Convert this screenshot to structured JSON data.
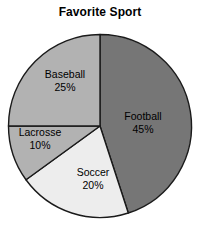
{
  "chart_data": {
    "type": "pie",
    "title": "Favorite Sport",
    "xlabel": "",
    "ylabel": "",
    "legend": "none",
    "grid": false,
    "categories": [
      "Football",
      "Soccer",
      "Lacrosse",
      "Baseball"
    ],
    "values": [
      45,
      20,
      10,
      25
    ],
    "units": "percent",
    "start_angle_deg": 0,
    "direction": "clockwise",
    "slices": [
      {
        "label": "Football",
        "value": 45,
        "value_text": "45%",
        "color": "#767676",
        "start_deg": 0,
        "end_deg": 162
      },
      {
        "label": "Soccer",
        "value": 20,
        "value_text": "20%",
        "color": "#ededed",
        "start_deg": 162,
        "end_deg": 234
      },
      {
        "label": "Lacrosse",
        "value": 10,
        "value_text": "10%",
        "color": "#b2b2b2",
        "start_deg": 234,
        "end_deg": 270
      },
      {
        "label": "Baseball",
        "value": 25,
        "value_text": "25%",
        "color": "#b2b2b2",
        "start_deg": 270,
        "end_deg": 360
      }
    ],
    "stroke_color": "#1a1a1a",
    "background_color": "#ffffff",
    "text_color": "#000000"
  }
}
